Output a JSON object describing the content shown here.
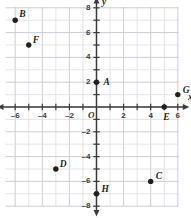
{
  "chart_data": {
    "type": "scatter",
    "title": "",
    "xlabel": "x",
    "ylabel": "y",
    "xlim": [
      -7,
      7
    ],
    "ylim": [
      -8,
      8
    ],
    "grid": true,
    "legend": "none",
    "origin_label": "O",
    "xticks": [
      -6,
      -4,
      -2,
      2,
      4,
      6
    ],
    "xtick_labels": [
      "–6",
      "–4",
      "–2",
      "2",
      "4",
      "6"
    ],
    "yticks": [
      8,
      6,
      4,
      2,
      -2,
      -4,
      -6,
      -8
    ],
    "ytick_labels": [
      "8",
      "6",
      "4",
      "2",
      "–2",
      "–4",
      "–6",
      "–8"
    ],
    "points": [
      {
        "label": "A",
        "x": 0,
        "y": 2,
        "label_dx": 7,
        "label_dy": -4
      },
      {
        "label": "B",
        "x": -6,
        "y": 7,
        "label_dx": 4,
        "label_dy": -10
      },
      {
        "label": "C",
        "x": 4,
        "y": -6,
        "label_dx": 5,
        "label_dy": -9
      },
      {
        "label": "D",
        "x": -3,
        "y": -5,
        "label_dx": 4,
        "label_dy": -9
      },
      {
        "label": "E",
        "x": 5,
        "y": 0,
        "label_dx": -1,
        "label_dy": 6
      },
      {
        "label": "F",
        "x": -5,
        "y": 5,
        "label_dx": 4,
        "label_dy": -9
      },
      {
        "label": "G",
        "x": 6,
        "y": 1,
        "label_dx": 5,
        "label_dy": -9
      },
      {
        "label": "H",
        "x": 0,
        "y": -7,
        "label_dx": 5,
        "label_dy": -9
      }
    ]
  },
  "style": {
    "point_color": "#231f20",
    "axis_color": "#3b3b3d",
    "grid_color": "#d8d9e0",
    "grid_color_major": "#c6c7d0",
    "background": "#ffffff"
  }
}
